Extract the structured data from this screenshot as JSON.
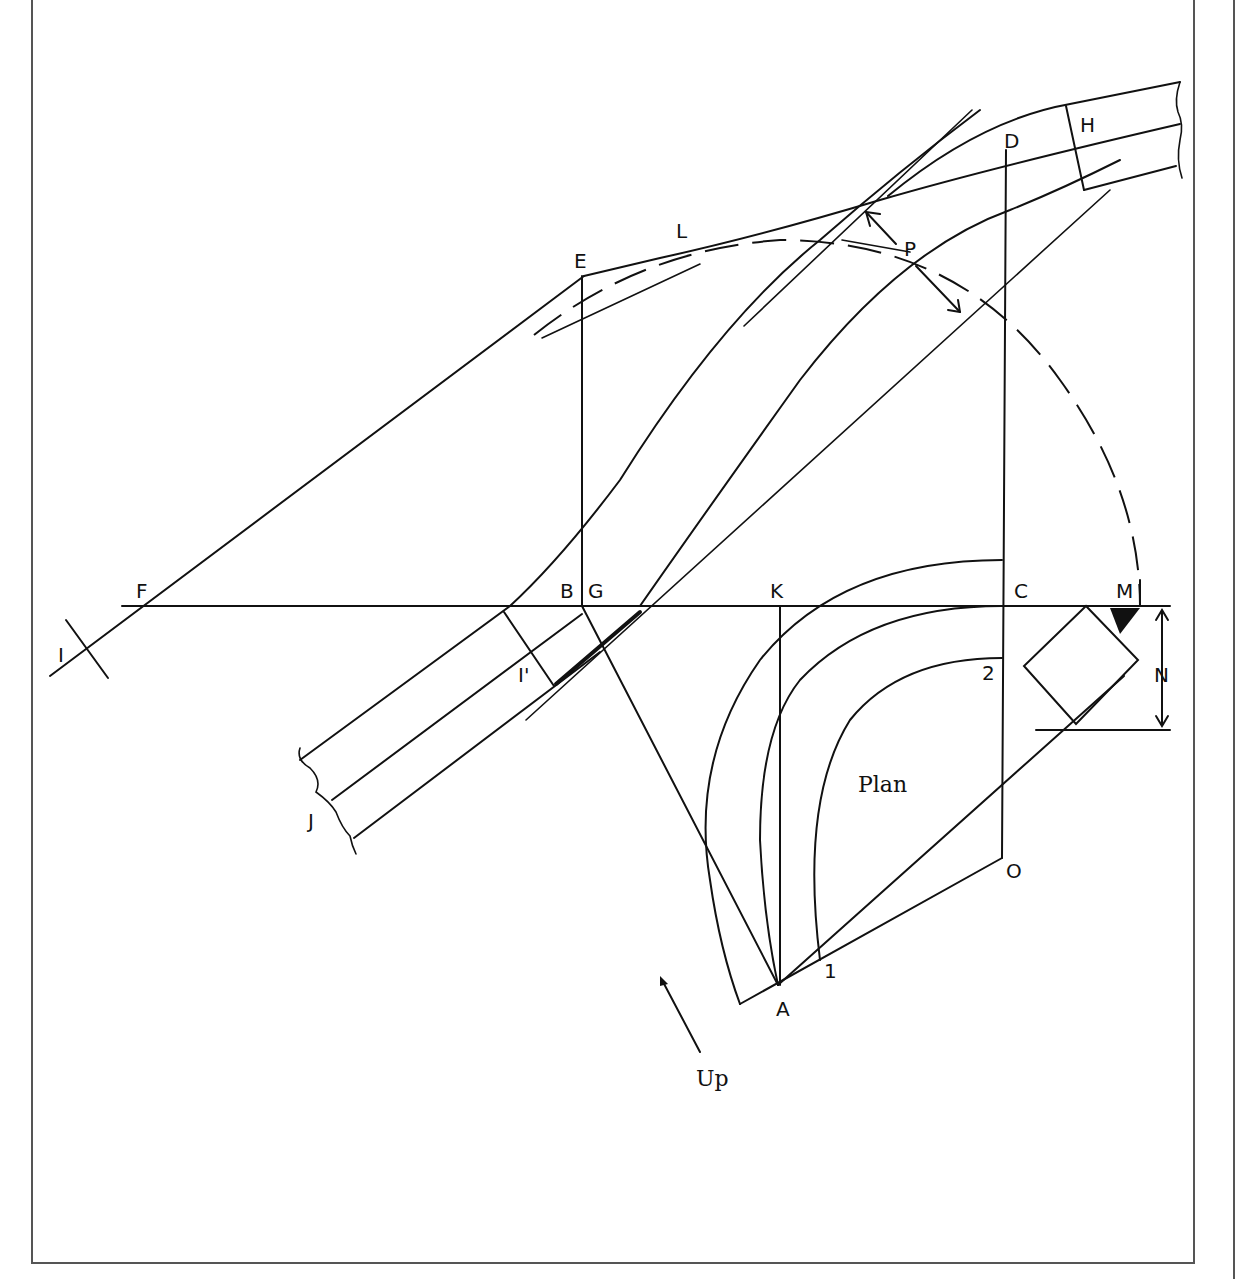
{
  "figure": {
    "labels": {
      "A": "A",
      "B": "B",
      "C": "C",
      "D": "D",
      "E": "E",
      "F": "F",
      "G": "G",
      "H": "H",
      "I": "I",
      "I_prime": "I'",
      "J": "J",
      "K": "K",
      "L": "L",
      "M": "M",
      "N": "N",
      "O": "O",
      "P": "P",
      "one": "1",
      "two": "2"
    },
    "plan_label": "Plan",
    "direction_label": "Up"
  }
}
